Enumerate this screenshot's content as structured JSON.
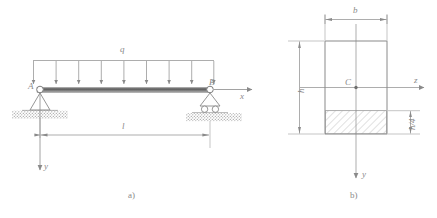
{
  "figure": {
    "panels": [
      {
        "id": "a",
        "caption": "a)",
        "labels": {
          "load": "q",
          "support_left": "A",
          "support_right": "B",
          "axis_x": "x",
          "axis_y": "y",
          "span": "l"
        },
        "load": {
          "type": "uniformly-distributed",
          "symbol": "q",
          "arrow_count": 9,
          "direction": "down"
        },
        "supports": {
          "left": "pin",
          "right": "roller"
        }
      },
      {
        "id": "b",
        "caption": "b)",
        "labels": {
          "width": "b",
          "height": "h",
          "centroid": "C",
          "axis_z": "z",
          "axis_y": "y",
          "shaded_height": "h/4"
        },
        "section": {
          "shape": "rectangle",
          "hatched_region": "bottom h/4 strip"
        }
      }
    ]
  },
  "colors": {
    "line": "#8a8a8a",
    "beam_dark": "#6e6e6e",
    "beam_light": "#9e9e9e",
    "hatch": "#a6a6a6",
    "ground": "#9a9a9a",
    "text": "#8a8a8a",
    "background": "#ffffff"
  }
}
